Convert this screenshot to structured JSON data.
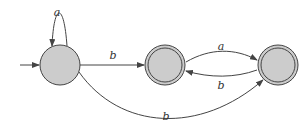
{
  "diagram": {
    "type": "finite-automaton",
    "colors": {
      "state_fill": "#cccccc",
      "stroke": "#444444",
      "background": "#ffffff"
    },
    "states": [
      {
        "id": "q0",
        "initial": true,
        "accepting": false
      },
      {
        "id": "q1",
        "initial": false,
        "accepting": true
      },
      {
        "id": "q2",
        "initial": false,
        "accepting": true
      }
    ],
    "transitions": [
      {
        "from": "q0",
        "to": "q0",
        "label": "a"
      },
      {
        "from": "q0",
        "to": "q1",
        "label": "b"
      },
      {
        "from": "q1",
        "to": "q2",
        "label": "a"
      },
      {
        "from": "q2",
        "to": "q1",
        "label": "b"
      },
      {
        "from": "q0",
        "to": "q2",
        "label": "b"
      }
    ]
  }
}
